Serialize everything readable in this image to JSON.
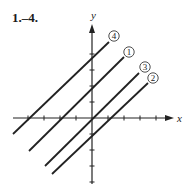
{
  "title": "1.–4.",
  "axes": {
    "x_label": "x",
    "y_label": "y",
    "origin_px": [
      92,
      118
    ],
    "unit_px": 16,
    "x_ticks": [
      -4,
      -3,
      -2,
      -1,
      1,
      2,
      3,
      4
    ],
    "y_ticks": [
      -4,
      -3,
      -2,
      -1,
      1,
      2,
      3,
      4
    ]
  },
  "lines": [
    {
      "label": "4",
      "equation": "y = x + 4",
      "slope": 1,
      "intercept": 4,
      "p1": [
        13,
        134
      ],
      "p2": [
        109,
        42
      ],
      "label_pos": [
        114,
        36
      ]
    },
    {
      "label": "1",
      "equation": "y = x + 2",
      "slope": 1,
      "intercept": 2,
      "p1": [
        29,
        151
      ],
      "p2": [
        124,
        57
      ],
      "label_pos": [
        129,
        52
      ]
    },
    {
      "label": "3",
      "equation": "y = x",
      "slope": 1,
      "intercept": 0,
      "p1": [
        45,
        166
      ],
      "p2": [
        139,
        73
      ],
      "label_pos": [
        145,
        67
      ]
    },
    {
      "label": "2",
      "equation": "y = x - 1",
      "slope": 1,
      "intercept": -1,
      "p1": [
        52,
        174
      ],
      "p2": [
        148,
        83
      ],
      "label_pos": [
        153,
        78
      ]
    }
  ],
  "colors": {
    "ink": "#222222",
    "background": "#ffffff"
  }
}
